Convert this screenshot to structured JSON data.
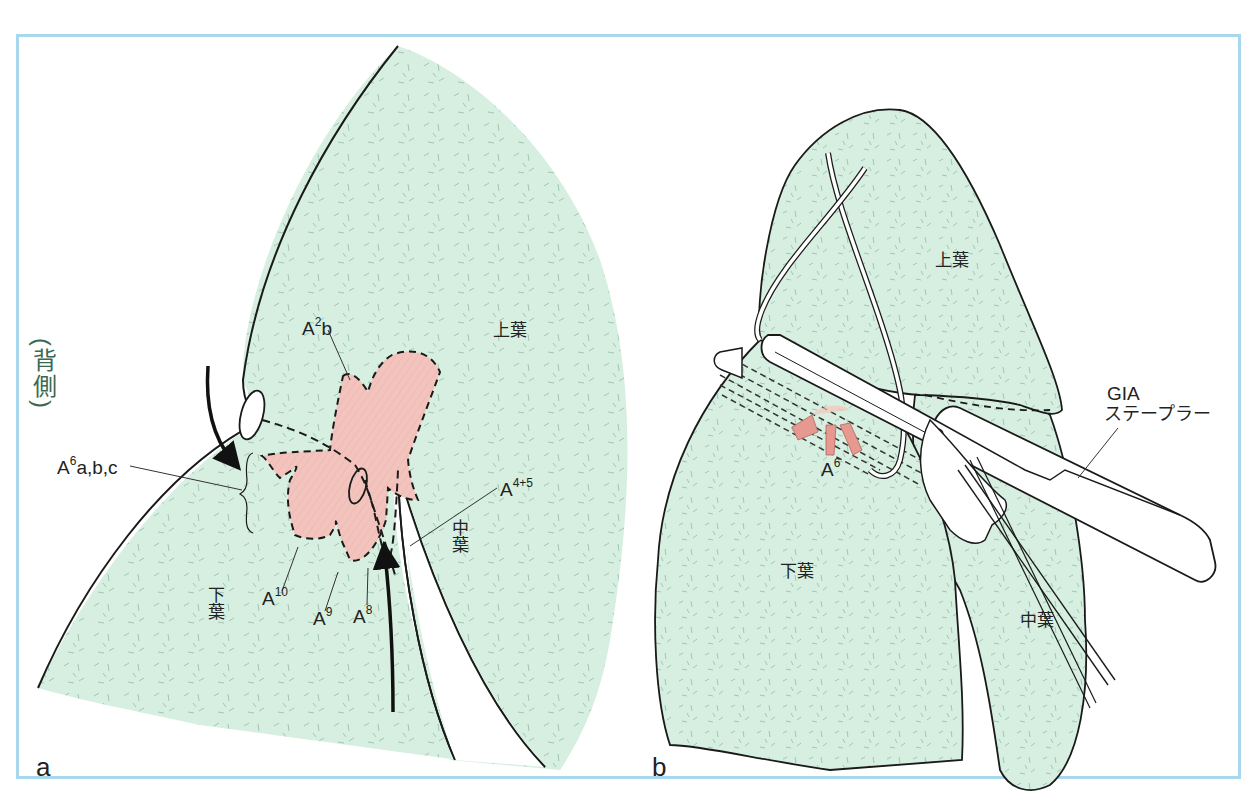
{
  "figure": {
    "colors": {
      "frame": "#a8d8ee",
      "lung_fill": "#d6efe0",
      "artery_fill": "#f3c4bd",
      "outline": "#1a1a1a",
      "side_label": "#3a6a52"
    },
    "panel_a": {
      "letter": "a",
      "side_label": "(背側)",
      "lobes": {
        "upper": "上葉",
        "middle": "中葉",
        "lower": "下葉"
      },
      "arteries": {
        "a2b": {
          "base": "A",
          "sup": "2",
          "suffix": "b"
        },
        "a6abc": {
          "base": "A",
          "sup": "6",
          "suffix": "a,b,c"
        },
        "a45": {
          "base": "A",
          "sup": "4+5",
          "suffix": ""
        },
        "a10": {
          "base": "A",
          "sup": "10",
          "suffix": ""
        },
        "a9": {
          "base": "A",
          "sup": "9",
          "suffix": ""
        },
        "a8": {
          "base": "A",
          "sup": "8",
          "suffix": ""
        }
      }
    },
    "panel_b": {
      "letter": "b",
      "lobes": {
        "upper": "上葉",
        "middle": "中葉",
        "lower": "下葉"
      },
      "arteries": {
        "a6": {
          "base": "A",
          "sup": "6",
          "suffix": ""
        }
      },
      "stapler_label_line1": "GIA",
      "stapler_label_line2": "ステープラー"
    }
  }
}
